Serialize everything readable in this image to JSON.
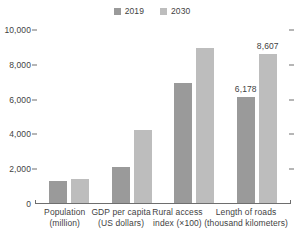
{
  "chart_data": {
    "type": "bar",
    "title": "",
    "subtitle": "",
    "xlabel": "",
    "ylabel": "",
    "ylim": [
      0,
      10000
    ],
    "yticks": [
      0,
      2000,
      4000,
      6000,
      8000,
      10000
    ],
    "ytick_labels": [
      "0",
      "2,000",
      "4,000",
      "6,000",
      "8,000",
      "10,000"
    ],
    "grid": false,
    "legend_position": "top-center",
    "categories": [
      "Population (million)",
      "GDP per capita (US dollars)",
      "Rural access index (×100)",
      "Length of roads (thousand kilometers)"
    ],
    "series": [
      {
        "name": "2019",
        "color": "#9a9a9a",
        "values": [
          1330,
          2100,
          6950,
          6178
        ]
      },
      {
        "name": "2030",
        "color": "#bdbdbd",
        "values": [
          1450,
          4250,
          8950,
          8607
        ]
      }
    ],
    "data_labels": [
      {
        "group": 3,
        "series": "2019",
        "text": "6,178"
      },
      {
        "group": 3,
        "series": "2030",
        "text": "8,607"
      }
    ]
  },
  "legend": {
    "entries": [
      {
        "label": "2019",
        "swatch_name": "legend-swatch-2019",
        "color": "#9a9a9a"
      },
      {
        "label": "2030",
        "swatch_name": "legend-swatch-2030",
        "color": "#bdbdbd"
      }
    ]
  },
  "yaxis": {
    "ticks": [
      {
        "value": 10000,
        "label": "10,000"
      },
      {
        "value": 8000,
        "label": "8,000"
      },
      {
        "value": 6000,
        "label": "6,000"
      },
      {
        "value": 4000,
        "label": "4,000"
      },
      {
        "value": 2000,
        "label": "2,000"
      },
      {
        "value": 0,
        "label": "0"
      }
    ]
  },
  "xaxis": {
    "groups": [
      {
        "line1": "Population",
        "line2": "(million)"
      },
      {
        "line1": "GDP per capita",
        "line2": "(US dollars)"
      },
      {
        "line1": "Rural access",
        "line2": "index (×100)"
      },
      {
        "line1": "Length of roads",
        "line2": "(thousand kilometers)"
      }
    ]
  },
  "colors": {
    "series_2019": "#9a9a9a",
    "series_2030": "#bdbdbd",
    "axis": "#6e6e6e",
    "text": "#3f3f3f",
    "background": "#ffffff"
  }
}
